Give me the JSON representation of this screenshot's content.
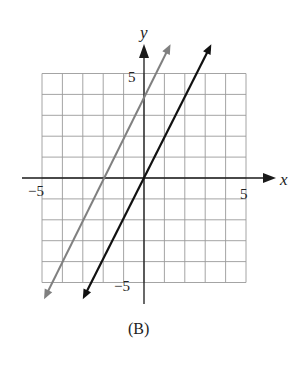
{
  "chart_data": {
    "type": "line",
    "title": "",
    "caption": "(B)",
    "xlabel": "x",
    "ylabel": "y",
    "xlim": [
      -5,
      5
    ],
    "ylim": [
      -5,
      5
    ],
    "grid": true,
    "grid_step": 1,
    "tick_labels": {
      "x_neg": "−5",
      "x_pos": "5",
      "y_pos": "5",
      "y_neg": "−5"
    },
    "series": [
      {
        "name": "gray-line",
        "equation": "y = 2x + 4",
        "slope": 2,
        "intercept": 4,
        "color": "#808080",
        "points": [
          [
            -4.9,
            -5.8
          ],
          [
            1.3,
            6.4
          ]
        ]
      },
      {
        "name": "black-line",
        "equation": "y = 2x",
        "slope": 2,
        "intercept": 0,
        "color": "#111111",
        "points": [
          [
            -3.0,
            -5.8
          ],
          [
            3.3,
            6.4
          ]
        ]
      }
    ]
  },
  "colors": {
    "grid": "#9a9a9a",
    "axis": "#1a1a1a",
    "gray_line": "#808080",
    "black_line": "#111111"
  }
}
